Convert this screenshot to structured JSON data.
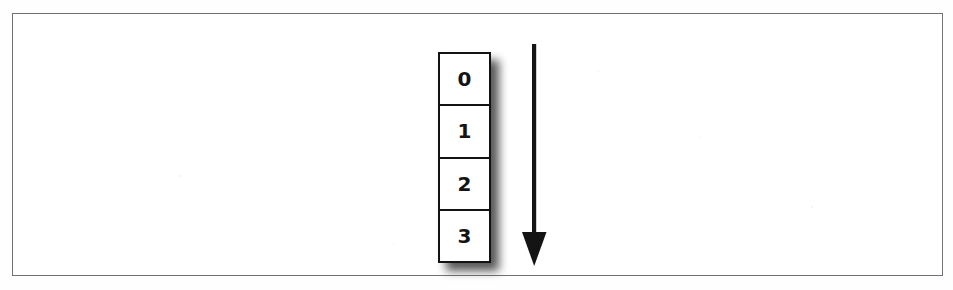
{
  "figure": {
    "kind": "stack-index-diagram",
    "frame": {
      "border_color": "#6f7377",
      "background": "#ffffff"
    }
  },
  "stack": {
    "name": "indexed-cell-stack",
    "border_color": "#131313",
    "fill_color": "#ffffff",
    "shadow_color": "#3a3a3a",
    "cells": [
      {
        "label": "0"
      },
      {
        "label": "1"
      },
      {
        "label": "2"
      },
      {
        "label": "3"
      }
    ]
  },
  "arrow": {
    "name": "downward-direction-arrow",
    "direction": "down",
    "color": "#141414"
  }
}
